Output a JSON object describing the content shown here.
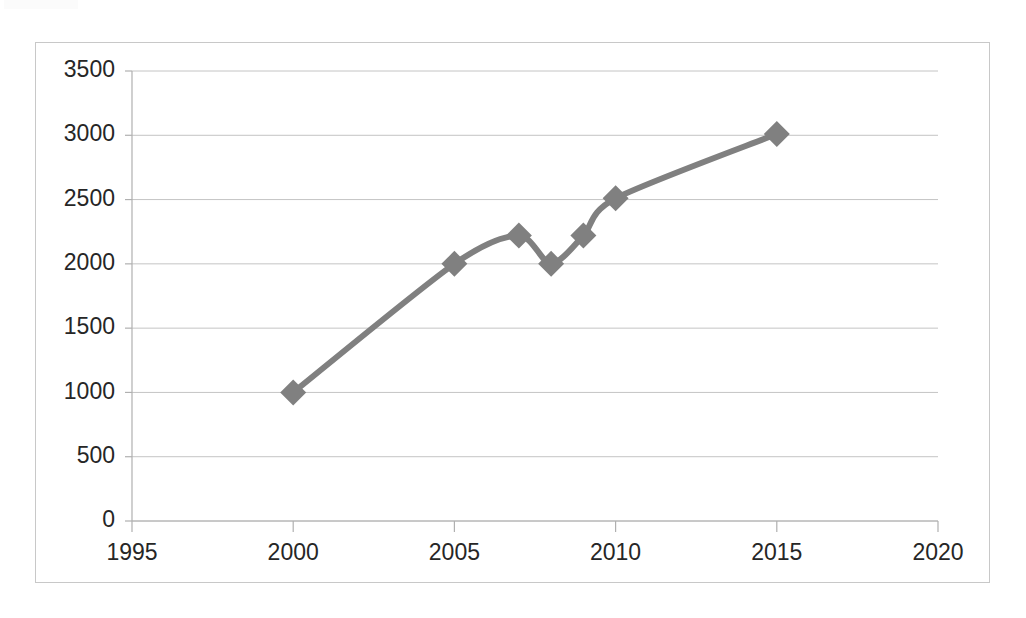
{
  "chart_data": {
    "type": "line",
    "title": "",
    "subtitle": "",
    "xlabel": "",
    "ylabel": "",
    "grid": "horizontal",
    "legend": "none",
    "xlim": [
      1995,
      2020
    ],
    "ylim": [
      0,
      3500
    ],
    "x_ticks": [
      1995,
      2000,
      2005,
      2010,
      2015,
      2020
    ],
    "x_tick_labels": [
      "1995",
      "2000",
      "2005",
      "2010",
      "2015",
      "2020"
    ],
    "y_ticks": [
      0,
      500,
      1000,
      1500,
      2000,
      2500,
      3000,
      3500
    ],
    "y_tick_labels": [
      "0",
      "500",
      "1000",
      "1500",
      "2000",
      "2500",
      "3000",
      "3500"
    ],
    "marker": "diamond",
    "series": [
      {
        "name": "Series 1",
        "color": "#808080",
        "x": [
          2000,
          2005,
          2007,
          2008,
          2009,
          2010,
          2015
        ],
        "values": [
          1000,
          2000,
          2220,
          2000,
          2220,
          2510,
          3010
        ],
        "points": [
          {
            "x": 2000,
            "y": 1000
          },
          {
            "x": 2005,
            "y": 2000
          },
          {
            "x": 2007,
            "y": 2220
          },
          {
            "x": 2008,
            "y": 2000
          },
          {
            "x": 2009,
            "y": 2220
          },
          {
            "x": 2010,
            "y": 2510
          },
          {
            "x": 2015,
            "y": 3010
          }
        ]
      }
    ]
  },
  "style": {
    "line_color": "#808080",
    "marker_color": "#808080",
    "gridline_color": "#c4c4c4",
    "axis_color": "#b0b0b0",
    "border_color": "#c8c8c8",
    "label_color": "#262626",
    "background": "#ffffff"
  }
}
